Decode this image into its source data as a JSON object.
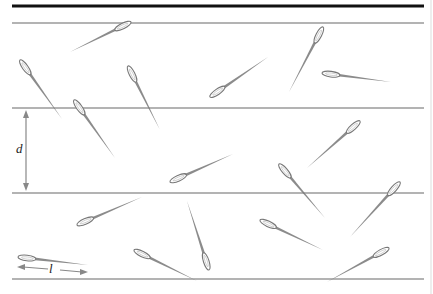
{
  "figure": {
    "labels": {
      "line_spacing": "d",
      "needle_length": "l"
    },
    "colors": {
      "top_rule": "#111111",
      "lines": "#9a9a9a",
      "needle": "#777777",
      "arrow": "#888888",
      "right_border": "#dddddd"
    },
    "top_rule_y": 6,
    "lines_y": [
      23,
      108,
      193,
      279
    ],
    "lines_x": [
      12,
      424
    ],
    "d_arrow": {
      "x": 26,
      "y1": 110,
      "y2": 191,
      "label_x": 16,
      "label_y": 155
    },
    "l_arrow": {
      "y": 269,
      "x1": 17,
      "x2": 88,
      "label_x": 49,
      "label_y": 275
    },
    "needles": [
      {
        "eye": [
          131,
          22
        ],
        "tip": [
          70,
          52
        ]
      },
      {
        "eye": [
          20,
          60
        ],
        "tip": [
          62,
          119
        ]
      },
      {
        "eye": [
          128,
          66
        ],
        "tip": [
          160,
          130
        ]
      },
      {
        "eye": [
          210,
          97
        ],
        "tip": [
          268,
          57
        ]
      },
      {
        "eye": [
          323,
          27
        ],
        "tip": [
          289,
          92
        ]
      },
      {
        "eye": [
          322,
          73
        ],
        "tip": [
          391,
          82
        ]
      },
      {
        "eye": [
          74,
          100
        ],
        "tip": [
          115,
          158
        ]
      },
      {
        "eye": [
          170,
          182
        ],
        "tip": [
          233,
          154
        ]
      },
      {
        "eye": [
          360,
          121
        ],
        "tip": [
          307,
          168
        ]
      },
      {
        "eye": [
          279,
          164
        ],
        "tip": [
          325,
          218
        ]
      },
      {
        "eye": [
          400,
          182
        ],
        "tip": [
          350,
          237
        ]
      },
      {
        "eye": [
          77,
          225
        ],
        "tip": [
          142,
          197
        ]
      },
      {
        "eye": [
          209,
          270
        ],
        "tip": [
          187,
          201
        ]
      },
      {
        "eye": [
          260,
          220
        ],
        "tip": [
          323,
          250
        ]
      },
      {
        "eye": [
          134,
          250
        ],
        "tip": [
          197,
          281
        ]
      },
      {
        "eye": [
          389,
          248
        ],
        "tip": [
          327,
          282
        ]
      },
      {
        "eye": [
          18,
          257
        ],
        "tip": [
          88,
          265
        ]
      }
    ]
  }
}
